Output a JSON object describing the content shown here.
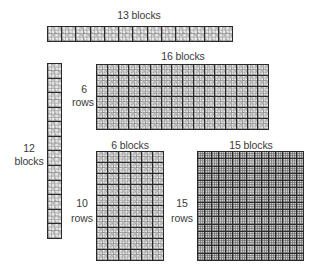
{
  "figure": {
    "top_strip": {
      "label": "13 blocks",
      "cols": 13,
      "rows": 1
    },
    "vertical_strip": {
      "label_count": "12",
      "label_unit": "blocks",
      "cols": 1,
      "rows": 12
    },
    "grid_16x6": {
      "top_label": "16 blocks",
      "side_count": "6",
      "side_unit": "rows",
      "cols": 16,
      "rows": 6
    },
    "grid_6x10": {
      "top_label": "6 blocks",
      "side_count": "10",
      "side_unit": "rows",
      "cols": 6,
      "rows": 10
    },
    "grid_15x15": {
      "top_label": "15 blocks",
      "side_count": "15",
      "side_unit": "rows",
      "cols": 15,
      "rows": 15
    }
  },
  "colors": {
    "line": "#2a2a2a",
    "block_light": "#e9e9e9",
    "block_shade": "#b8b8b8",
    "text": "#3a3a3a"
  }
}
